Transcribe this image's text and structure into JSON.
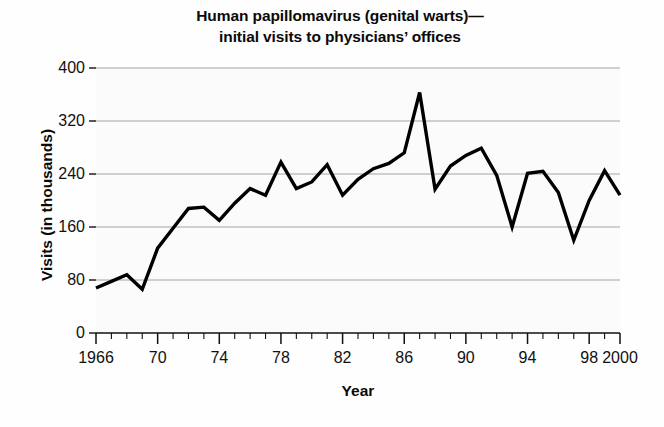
{
  "chart_data": {
    "type": "line",
    "title": "Human papillomavirus (genital warts)— initial visits to physicians’ offices",
    "title_line1": "Human papillomavirus (genital warts)—",
    "title_line2": "initial visits to physicians’ offices",
    "xlabel": "Year",
    "ylabel": "Visits (in thousands)",
    "ylim": [
      0,
      400
    ],
    "xlim": [
      1966,
      2000
    ],
    "grid": true,
    "grid_axis": "y",
    "legend": "none",
    "line_color": "#000000",
    "background_color": "#fbfbfb",
    "y_ticks": [
      0,
      80,
      160,
      240,
      320,
      400
    ],
    "y_tick_labels": [
      "0",
      "80",
      "160",
      "240",
      "320",
      "400"
    ],
    "x_ticks": [
      1966,
      1970,
      1974,
      1978,
      1982,
      1986,
      1990,
      1994,
      1998,
      2000
    ],
    "x_tick_labels": [
      "1966",
      "70",
      "74",
      "78",
      "82",
      "86",
      "90",
      "94",
      "98",
      "2000"
    ],
    "x_minor_tick_interval": 1,
    "x": [
      1966,
      1967,
      1968,
      1969,
      1970,
      1971,
      1972,
      1973,
      1974,
      1975,
      1976,
      1977,
      1978,
      1979,
      1980,
      1981,
      1982,
      1983,
      1984,
      1985,
      1986,
      1987,
      1988,
      1989,
      1990,
      1991,
      1992,
      1993,
      1994,
      1995,
      1996,
      1997,
      1998,
      1999,
      2000
    ],
    "values": [
      68,
      78,
      88,
      66,
      128,
      158,
      188,
      190,
      170,
      196,
      218,
      208,
      258,
      218,
      228,
      254,
      208,
      232,
      248,
      256,
      272,
      363,
      217,
      252,
      268,
      279,
      238,
      160,
      241,
      244,
      212,
      140,
      200,
      245,
      208
    ],
    "series": [
      {
        "name": "Initial visits to physicians’ offices",
        "values": [
          68,
          78,
          88,
          66,
          128,
          158,
          188,
          190,
          170,
          196,
          218,
          208,
          258,
          218,
          228,
          254,
          208,
          232,
          248,
          256,
          272,
          363,
          217,
          252,
          268,
          279,
          238,
          160,
          241,
          244,
          212,
          140,
          200,
          245,
          208
        ]
      }
    ],
    "units": "thousands of visits",
    "peak": {
      "year": 1987,
      "value": 363
    },
    "minimum": {
      "year": 1969,
      "value": 66
    }
  }
}
